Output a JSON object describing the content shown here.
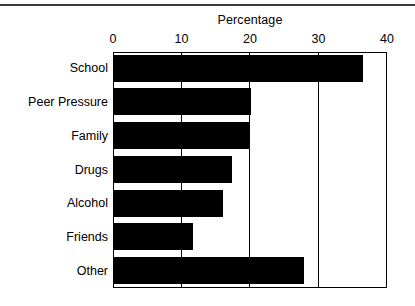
{
  "figure": {
    "top_rule": "horizontal-rule",
    "background_color": "#ffffff",
    "bar_color": "#000000",
    "axis_color": "#000000"
  },
  "chart_data": {
    "type": "bar",
    "orientation": "horizontal",
    "title": "Percentage",
    "xlabel": "",
    "ylabel": "",
    "categories": [
      "School",
      "Peer Pressure",
      "Family",
      "Drugs",
      "Alcohol",
      "Friends",
      "Other"
    ],
    "values": [
      36.4,
      20.0,
      19.8,
      17.2,
      15.9,
      11.5,
      27.7
    ],
    "xlim": [
      0,
      40
    ],
    "xticks": [
      0,
      10,
      20,
      30,
      40
    ],
    "xtick_labels": [
      "0",
      "10",
      "20",
      "30",
      "40"
    ],
    "grid": true,
    "grid_axis": "x",
    "legend": false,
    "series": [
      {
        "name": "Percentage",
        "values": [
          36.4,
          20.0,
          19.8,
          17.2,
          15.9,
          11.5,
          27.7
        ]
      }
    ]
  }
}
